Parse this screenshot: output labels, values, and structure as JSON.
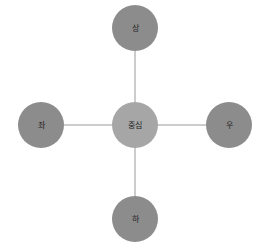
{
  "diagram": {
    "type": "star",
    "center": {
      "id": "center",
      "label": "중심",
      "color": "#a6a6a6"
    },
    "nodes": [
      {
        "id": "top",
        "label": "상",
        "color": "#8c8c8c"
      },
      {
        "id": "left",
        "label": "좌",
        "color": "#8c8c8c"
      },
      {
        "id": "right",
        "label": "우",
        "color": "#8c8c8c"
      },
      {
        "id": "bottom",
        "label": "하",
        "color": "#8c8c8c"
      }
    ],
    "edge_color": "#9a9a9a"
  }
}
